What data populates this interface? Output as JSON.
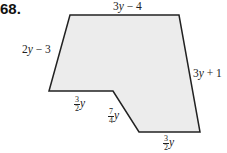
{
  "problem_number": "68.",
  "figure": {
    "fill_color": "#ececec",
    "stroke_color": "#222222",
    "vertices": [
      [
        70,
        15
      ],
      [
        179,
        15
      ],
      [
        200,
        132
      ],
      [
        139,
        132
      ],
      [
        113,
        91
      ],
      [
        49,
        91
      ]
    ]
  },
  "labels": {
    "top": {
      "expr": "3y − 4",
      "coef": "3",
      "var": "y",
      "rest": " − 4"
    },
    "left": {
      "coef": "2",
      "var": "y",
      "rest": " − 3"
    },
    "right": {
      "coef": "3",
      "var": "y",
      "rest": " + 1"
    },
    "step_horizontal": {
      "num": "3",
      "den": "2",
      "var": "y"
    },
    "step_diagonal": {
      "num": "7",
      "den": "4",
      "var": "y"
    },
    "bottom": {
      "num": "3",
      "den": "2",
      "var": "y"
    }
  }
}
